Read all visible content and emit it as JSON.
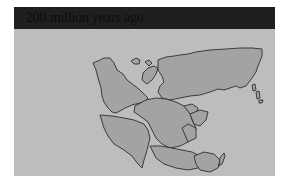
{
  "title": "200 million years ago",
  "colors": {
    "title_bar": "#1f1f1f",
    "title_text": "#0d0d0d",
    "ocean": "#bdbdbd",
    "land": "#a3a3a3",
    "coastline": "#2e2e2e"
  },
  "map": {
    "description": "Pangaea supercontinent",
    "landmasses": [
      "north-america",
      "eurasia",
      "south-america",
      "africa",
      "india",
      "antarctica",
      "australia",
      "islands"
    ]
  }
}
